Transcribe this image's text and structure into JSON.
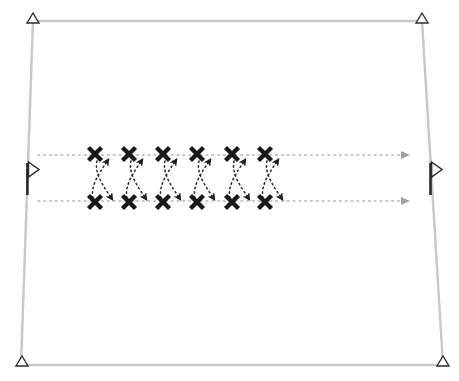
{
  "canvas": {
    "width": 459,
    "height": 381,
    "background": "#ffffff",
    "title": "Sports play diagram: double stack weave drill"
  },
  "colors": {
    "field_line": "#c8c8c8",
    "dotted_path": "#b4b4b4",
    "marker_dark": "#1a1a1a",
    "arrow_gray": "#9a9a9a",
    "corner_outline": "#333333"
  },
  "field": {
    "name": "field-boundary",
    "shape": "quadrilateral",
    "stroke": "#c8c8c8",
    "stroke_width": 2.4,
    "corners": [
      {
        "name": "top-left",
        "x": 33,
        "y": 21
      },
      {
        "name": "top-right",
        "x": 422,
        "y": 21
      },
      {
        "name": "bottom-right",
        "x": 443,
        "y": 365
      },
      {
        "name": "bottom-left",
        "x": 21,
        "y": 365
      }
    ]
  },
  "corner_markers": [
    {
      "name": "corner-flag-top-left",
      "x": 33,
      "y": 21,
      "glyph": "triangle-outline-up"
    },
    {
      "name": "corner-flag-top-right",
      "x": 422,
      "y": 21,
      "glyph": "triangle-outline-up"
    },
    {
      "name": "corner-flag-bottom-right",
      "x": 443,
      "y": 364,
      "glyph": "triangle-outline-up"
    },
    {
      "name": "corner-flag-bottom-left",
      "x": 22,
      "y": 364,
      "glyph": "triangle-outline-up"
    }
  ],
  "side_flags": [
    {
      "name": "left-side-flag",
      "x": 27,
      "y": 162,
      "pole_height": 32,
      "glyph": "triangle-outline-right"
    },
    {
      "name": "right-side-flag",
      "x": 430,
      "y": 162,
      "pole_height": 32,
      "glyph": "triangle-outline-right"
    }
  ],
  "lanes": [
    {
      "name": "upper-lane",
      "y": 155,
      "x_start": 38,
      "x_end": 405,
      "style": "dotted",
      "arrow_end": "right",
      "color": "#b4b4b4"
    },
    {
      "name": "lower-lane",
      "y": 201,
      "x_start": 38,
      "x_end": 405,
      "style": "dotted",
      "arrow_end": "right",
      "color": "#b4b4b4"
    }
  ],
  "player_markers": {
    "glyph": "x-marker",
    "color": "#1a1a1a",
    "size": 13,
    "top_row": [
      {
        "name": "player-top-1",
        "x": 95,
        "y": 154
      },
      {
        "name": "player-top-2",
        "x": 129,
        "y": 154
      },
      {
        "name": "player-top-3",
        "x": 163,
        "y": 154
      },
      {
        "name": "player-top-4",
        "x": 197,
        "y": 154
      },
      {
        "name": "player-top-5",
        "x": 232,
        "y": 154
      },
      {
        "name": "player-top-6",
        "x": 265,
        "y": 154
      }
    ],
    "bottom_row": [
      {
        "name": "player-bottom-1",
        "x": 95,
        "y": 202
      },
      {
        "name": "player-bottom-2",
        "x": 129,
        "y": 202
      },
      {
        "name": "player-bottom-3",
        "x": 163,
        "y": 202
      },
      {
        "name": "player-bottom-4",
        "x": 197,
        "y": 202
      },
      {
        "name": "player-bottom-5",
        "x": 232,
        "y": 202
      },
      {
        "name": "player-bottom-6",
        "x": 265,
        "y": 202
      }
    ]
  },
  "movement_paths": {
    "style": "dotted-curved-with-arrowhead",
    "color": "#2a2a2a",
    "pairs": [
      {
        "name": "weave-pair-1",
        "x": 95
      },
      {
        "name": "weave-pair-2",
        "x": 129
      },
      {
        "name": "weave-pair-3",
        "x": 163
      },
      {
        "name": "weave-pair-4",
        "x": 197
      },
      {
        "name": "weave-pair-5",
        "x": 232
      },
      {
        "name": "weave-pair-6",
        "x": 265
      }
    ],
    "up_path": {
      "name": "path-upward",
      "description": "from bottom marker curving up-right to upper lane",
      "arrow_direction": "up-right"
    },
    "down_path": {
      "name": "path-downward",
      "description": "from top marker curving down-right to lower lane",
      "arrow_direction": "down-right"
    }
  }
}
